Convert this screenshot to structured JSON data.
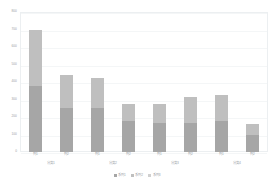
{
  "chart_data": {
    "type": "bar",
    "stacked": true,
    "title": "",
    "xlabel": "",
    "ylabel": "",
    "ylim": [
      0,
      800
    ],
    "grid": true,
    "legend_position": "bottom",
    "categories": [
      "列1",
      "列2",
      "列1",
      "列2",
      "列1",
      "列2",
      "列1",
      "列2"
    ],
    "groups": [
      {
        "label": "分类1",
        "span": 2
      },
      {
        "label": "分类2",
        "span": 2
      },
      {
        "label": "分类3",
        "span": 2
      },
      {
        "label": "分类4",
        "span": 2
      }
    ],
    "ytick_labels": [
      "800",
      "700",
      "600",
      "500",
      "400",
      "300",
      "200",
      "100",
      "0"
    ],
    "ytick_values": [
      800,
      700,
      600,
      500,
      400,
      300,
      200,
      100,
      0
    ],
    "series": [
      {
        "name": "系列1",
        "color": "#a6a6a6",
        "values": [
          380,
          250,
          250,
          180,
          165,
          165,
          175,
          95
        ]
      },
      {
        "name": "系列2",
        "color": "#bfbfbf",
        "values": [
          315,
          190,
          175,
          95,
          110,
          150,
          150,
          65
        ]
      },
      {
        "name": "系列3",
        "color": "#d0d0d0",
        "values": [
          0,
          0,
          0,
          0,
          0,
          0,
          0,
          0
        ]
      }
    ],
    "totals": [
      695,
      440,
      425,
      275,
      275,
      315,
      325,
      160
    ]
  },
  "colors": {
    "plot_border": "#eceff1",
    "gridline": "#f4f6f7",
    "tick_text": "#9aa0a6",
    "background": "#ffffff"
  }
}
